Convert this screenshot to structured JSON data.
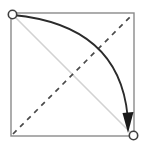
{
  "figure": {
    "title": "",
    "caption": "",
    "width": 145,
    "height": 149,
    "background_color": "#ffffff"
  },
  "chart_data": {
    "type": "diagram",
    "title": "",
    "xlabel": "",
    "ylabel": "",
    "xlim": [
      0,
      1
    ],
    "ylim": [
      0,
      1
    ],
    "grid": false,
    "legend": "none",
    "frame": {
      "label": "square-frame",
      "x0": 11,
      "y0": 13,
      "x1": 134,
      "y1": 136,
      "color": "#8a8a8a",
      "stroke_width": 1.4,
      "fill": "#ffffff"
    },
    "nodes": [
      {
        "name": "start-node",
        "label": "",
        "x": 12,
        "y": 14,
        "radius": 4.2,
        "fill": "#ffffff",
        "stroke": "#3f3f3f",
        "stroke_width": 1.6
      },
      {
        "name": "end-node",
        "label": "",
        "x": 133,
        "y": 135,
        "radius": 4.2,
        "fill": "#ffffff",
        "stroke": "#3f3f3f",
        "stroke_width": 1.6
      }
    ],
    "series": [
      {
        "name": "curved-arc",
        "style": "solid-curve",
        "color": "#2b2b2b",
        "stroke_width": 1.8,
        "path": "M 13 15 Q 118 24 128 118",
        "arrowhead": {
          "present": true,
          "shape": "filled-triangle",
          "direction": "down",
          "tip_x": 128,
          "tip_y": 133,
          "color": "#1a1a1a",
          "width": 11,
          "length": 18
        }
      },
      {
        "name": "straight-chord",
        "style": "solid",
        "color": "#d2d2d2",
        "stroke_width": 1.6,
        "x0": 14,
        "y0": 16,
        "x1": 131,
        "y1": 133
      },
      {
        "name": "dashed-anti-diagonal",
        "style": "dashed",
        "color": "#4a4a4a",
        "stroke_width": 1.7,
        "dash_pattern": "5 5",
        "x0": 13,
        "y0": 134,
        "x1": 132,
        "y1": 15
      }
    ]
  }
}
